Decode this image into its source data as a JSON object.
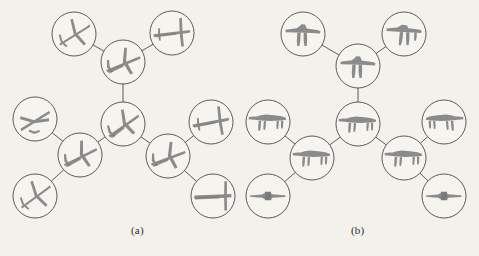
{
  "figure": {
    "background_color": "#f3f1ec",
    "ink_color": "#4a4a4a",
    "silhouette_color": "#8b8b8b",
    "panels": [
      {
        "id": "a",
        "caption": "(a)",
        "caption_x": 131,
        "caption_y": 224,
        "object_class": "airplane",
        "node_radius": 22,
        "nodes": [
          {
            "id": "a1",
            "cx": 74,
            "cy": 34,
            "name": "airplane-top-left",
            "view": "top-view-nose-up-right",
            "rot": -28,
            "scale": 1.0
          },
          {
            "id": "a2",
            "cx": 123,
            "cy": 62,
            "name": "airplane-upper-center",
            "view": "oblique-nose-left",
            "rot": -12,
            "scale": 1.0
          },
          {
            "id": "a3",
            "cx": 172,
            "cy": 33,
            "name": "airplane-top-right",
            "view": "side-nose-left",
            "rot": -4,
            "scale": 1.0
          },
          {
            "id": "a4",
            "cx": 123,
            "cy": 124,
            "name": "airplane-center",
            "view": "oblique-nose-up-left",
            "rot": -25,
            "scale": 1.0
          },
          {
            "id": "a5",
            "cx": 35,
            "cy": 119,
            "name": "airplane-mid-left",
            "view": "top-view-nose-up",
            "rot": -80,
            "scale": 1.0
          },
          {
            "id": "a6",
            "cx": 80,
            "cy": 155,
            "name": "airplane-lower-left",
            "view": "oblique-nose-left",
            "rot": -16,
            "scale": 1.0
          },
          {
            "id": "a7",
            "cx": 35,
            "cy": 196,
            "name": "airplane-bottom-left",
            "view": "top-view-nose-up-right",
            "rot": -32,
            "scale": 1.0
          },
          {
            "id": "a8",
            "cx": 168,
            "cy": 156,
            "name": "airplane-lower-right",
            "view": "oblique-nose-left",
            "rot": -10,
            "scale": 1.0
          },
          {
            "id": "a9",
            "cx": 211,
            "cy": 122,
            "name": "airplane-mid-right",
            "view": "side-nose-left",
            "rot": -8,
            "scale": 1.0
          },
          {
            "id": "a10",
            "cx": 213,
            "cy": 196,
            "name": "airplane-bottom-right",
            "view": "side-nose-left-flat",
            "rot": 0,
            "scale": 1.0
          }
        ],
        "edges": [
          {
            "from": "a1",
            "to": "a2",
            "name": "edge-a1-a2"
          },
          {
            "from": "a2",
            "to": "a3",
            "name": "edge-a2-a3"
          },
          {
            "from": "a2",
            "to": "a4",
            "name": "edge-a2-a4"
          },
          {
            "from": "a4",
            "to": "a6",
            "name": "edge-a4-a6"
          },
          {
            "from": "a6",
            "to": "a5",
            "name": "edge-a6-a5"
          },
          {
            "from": "a6",
            "to": "a7",
            "name": "edge-a6-a7"
          },
          {
            "from": "a4",
            "to": "a8",
            "name": "edge-a4-a8"
          },
          {
            "from": "a8",
            "to": "a9",
            "name": "edge-a8-a9"
          },
          {
            "from": "a8",
            "to": "a10",
            "name": "edge-a8-a10"
          }
        ]
      },
      {
        "id": "b",
        "caption": "(b)",
        "caption_x": 351,
        "caption_y": 224,
        "object_class": "quadruped-animal",
        "node_radius": 22,
        "nodes": [
          {
            "id": "b1",
            "cx": 303,
            "cy": 34,
            "name": "animal-top-left",
            "view": "front-view",
            "rot": 0,
            "scale": 1.0
          },
          {
            "id": "b2",
            "cx": 358,
            "cy": 66,
            "name": "animal-upper-center",
            "view": "front-view",
            "rot": 0,
            "scale": 1.0
          },
          {
            "id": "b3",
            "cx": 404,
            "cy": 34,
            "name": "animal-top-right",
            "view": "front-three-quarter",
            "rot": 0,
            "scale": 1.0
          },
          {
            "id": "b4",
            "cx": 358,
            "cy": 124,
            "name": "animal-center",
            "view": "three-quarter-left",
            "rot": 0,
            "scale": 1.0
          },
          {
            "id": "b5",
            "cx": 268,
            "cy": 122,
            "name": "animal-mid-left",
            "view": "side-head-left",
            "rot": 0,
            "scale": 1.0
          },
          {
            "id": "b6",
            "cx": 312,
            "cy": 158,
            "name": "animal-lower-left",
            "view": "side-head-left",
            "rot": 0,
            "scale": 1.0
          },
          {
            "id": "b7",
            "cx": 268,
            "cy": 196,
            "name": "animal-bottom-left",
            "view": "rear-view",
            "rot": 0,
            "scale": 1.0
          },
          {
            "id": "b8",
            "cx": 404,
            "cy": 158,
            "name": "animal-lower-right",
            "view": "side-head-left",
            "rot": 0,
            "scale": 1.0
          },
          {
            "id": "b9",
            "cx": 444,
            "cy": 122,
            "name": "animal-mid-right",
            "view": "side-head-right",
            "rot": 0,
            "scale": 1.0
          },
          {
            "id": "b10",
            "cx": 444,
            "cy": 196,
            "name": "animal-bottom-right",
            "view": "rear-view",
            "rot": 0,
            "scale": 1.0
          }
        ],
        "edges": [
          {
            "from": "b1",
            "to": "b2",
            "name": "edge-b1-b2"
          },
          {
            "from": "b2",
            "to": "b3",
            "name": "edge-b2-b3"
          },
          {
            "from": "b2",
            "to": "b4",
            "name": "edge-b2-b4"
          },
          {
            "from": "b4",
            "to": "b6",
            "name": "edge-b4-b6"
          },
          {
            "from": "b6",
            "to": "b5",
            "name": "edge-b6-b5"
          },
          {
            "from": "b6",
            "to": "b7",
            "name": "edge-b6-b7"
          },
          {
            "from": "b4",
            "to": "b8",
            "name": "edge-b4-b8"
          },
          {
            "from": "b8",
            "to": "b9",
            "name": "edge-b8-b9"
          },
          {
            "from": "b8",
            "to": "b10",
            "name": "edge-b8-b10"
          }
        ]
      }
    ]
  }
}
